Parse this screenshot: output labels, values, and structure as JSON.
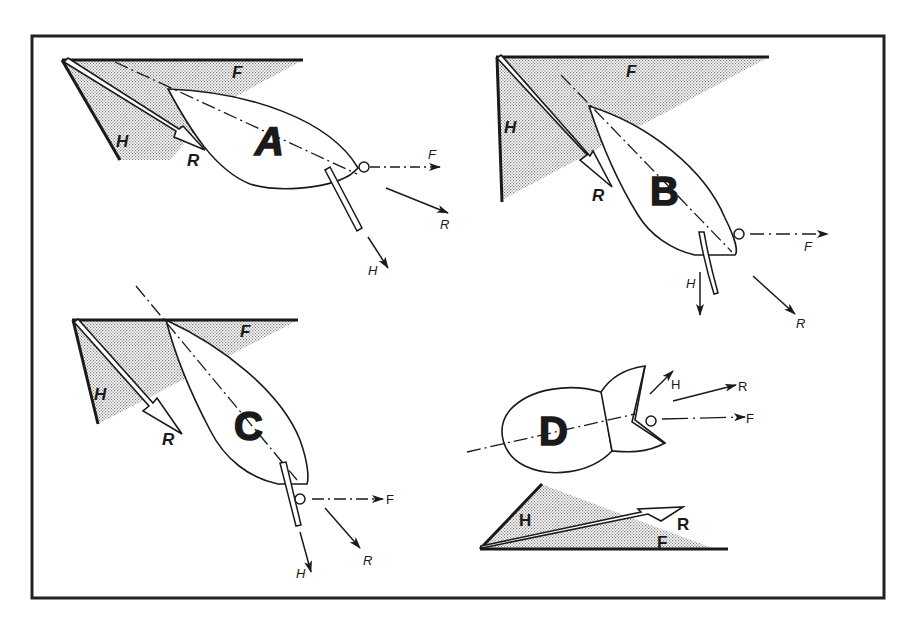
{
  "figure": {
    "frame": {
      "x": 32,
      "y": 36,
      "width": 852,
      "height": 562,
      "stroke": "#222222"
    },
    "colors": {
      "ink": "#1a1a1a",
      "stipple": "#9a9a9a",
      "hull_fill": "#ffffff"
    },
    "legend_note": "H = heeling (lateral) force, F = forward driving force, R = resultant force",
    "panels": [
      {
        "id": "A",
        "letter": "A",
        "triangle_labels": {
          "F": "F",
          "H": "H",
          "R": "R"
        },
        "vector_labels": {
          "F": "F",
          "R": "R",
          "H": "H"
        }
      },
      {
        "id": "B",
        "letter": "B",
        "triangle_labels": {
          "F": "F",
          "H": "H",
          "R": "R"
        },
        "vector_labels": {
          "F": "F",
          "R": "R",
          "H": "H"
        }
      },
      {
        "id": "C",
        "letter": "C",
        "triangle_labels": {
          "F": "F",
          "H": "H",
          "R": "R"
        },
        "vector_labels": {
          "F": "F",
          "R": "R",
          "H": "H"
        }
      },
      {
        "id": "D",
        "letter": "D",
        "triangle_labels": {
          "F": "F",
          "H": "H",
          "R": "R"
        },
        "vector_labels": {
          "F": "F",
          "R": "R",
          "H": "H"
        }
      }
    ]
  }
}
